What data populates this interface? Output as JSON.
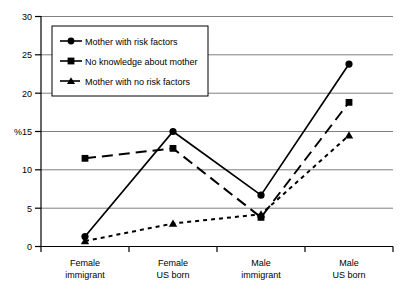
{
  "chart_data": {
    "type": "line",
    "title": "",
    "xlabel": "",
    "ylabel": "%",
    "categories": [
      "Female\nimmigrant",
      "Female\nUS born",
      "Male\nimmigrant",
      "Male\nUS born"
    ],
    "category_lines": [
      [
        "Female",
        "immigrant"
      ],
      [
        "Female",
        "US born"
      ],
      [
        "Male",
        "immigrant"
      ],
      [
        "Male",
        "US born"
      ]
    ],
    "ylim": [
      0,
      30
    ],
    "ytick_step": 5,
    "yticks": [
      0,
      5,
      10,
      15,
      20,
      25,
      30
    ],
    "ytick_labels": [
      "0",
      "5",
      "10",
      "15",
      "20",
      "25",
      "30"
    ],
    "grid": true,
    "grid_axis": "y",
    "legend_position": "upper-left-inside",
    "series": [
      {
        "name": "Mother with risk factors",
        "values": [
          1.3,
          15.0,
          6.7,
          23.8
        ],
        "marker": "circle",
        "line_style": "solid",
        "color": "#000000"
      },
      {
        "name": "No knowledge about mother",
        "values": [
          11.5,
          12.8,
          3.8,
          18.8
        ],
        "marker": "square",
        "line_style": "dashed",
        "color": "#000000"
      },
      {
        "name": "Mother with no risk factors",
        "values": [
          0.7,
          3.0,
          4.2,
          14.5
        ],
        "marker": "triangle",
        "line_style": "dotted",
        "color": "#000000"
      }
    ]
  },
  "legend": {
    "items": [
      {
        "label": "Mother with risk factors",
        "marker": "circle-marker-icon"
      },
      {
        "label": "No knowledge about mother",
        "marker": "square-marker-icon"
      },
      {
        "label": "Mother with no risk factors",
        "marker": "triangle-marker-icon"
      }
    ]
  },
  "axis": {
    "y_axis_title": "%",
    "y_labels": [
      "30",
      "25",
      "20",
      "15",
      "10",
      "5",
      "0"
    ],
    "x_labels_line1": [
      "Female",
      "Female",
      "Male",
      "Male"
    ],
    "x_labels_line2": [
      "immigrant",
      "US born",
      "immigrant",
      "US born"
    ]
  },
  "colors": {
    "plot_background": "#ffffff",
    "gridline": "#808080",
    "axis": "#000000",
    "series": "#000000",
    "legend_border": "#000000"
  }
}
